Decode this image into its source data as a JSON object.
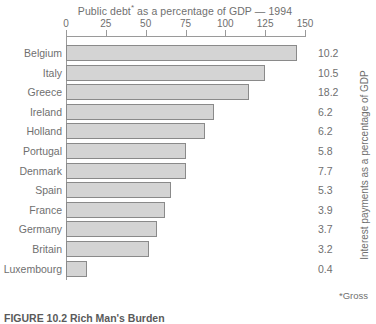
{
  "chart_data": {
    "type": "bar",
    "orientation": "horizontal",
    "title": "Public debt* as a percentage of GDP — 1994",
    "title_main": "Public debt",
    "title_asterisk": "*",
    "title_rest": " as a percentage of GDP — 1994",
    "xlabel": "",
    "ylabel": "",
    "right_axis_label": "Interest payments as a percentage of GDP",
    "footnote": "*Gross",
    "xlim": [
      0,
      150
    ],
    "xticks": [
      0,
      25,
      50,
      75,
      100,
      125,
      150
    ],
    "xtick_labels": [
      "0",
      "25",
      "50",
      "75",
      "100",
      "125",
      "150"
    ],
    "grid": false,
    "legend": null,
    "categories": [
      "Belgium",
      "Italy",
      "Greece",
      "Ireland",
      "Holland",
      "Portugal",
      "Denmark",
      "Spain",
      "France",
      "Germany",
      "Britain",
      "Luxembourg"
    ],
    "values": [
      145,
      125,
      115,
      93,
      87,
      75,
      75,
      66,
      62,
      57,
      52,
      13
    ],
    "data_labels": [
      "10.2",
      "10.5",
      "18.2",
      "6.2",
      "6.2",
      "5.8",
      "7.7",
      "5.3",
      "3.9",
      "3.7",
      "3.2",
      "0.4"
    ],
    "data_label_series_name": "Interest payments as a percentage of GDP",
    "bar_color": "#d4d4d4",
    "bar_border_color": "#8a8a8a",
    "axis_color": "#9a9a9a",
    "text_color": "#6f6f6f"
  },
  "caption": {
    "text": "FIGURE 10.2   Rich Man's Burden"
  }
}
